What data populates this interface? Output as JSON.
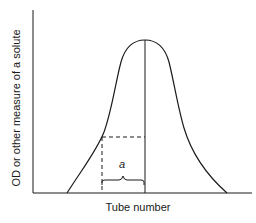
{
  "diagram": {
    "type": "elution-profile",
    "x_axis_label": "Tube number",
    "y_axis_label": "OD or other measure of a solute",
    "annotation_label": "a",
    "curve": "bell-shaped peak",
    "line_color": "#1a1a1a"
  }
}
